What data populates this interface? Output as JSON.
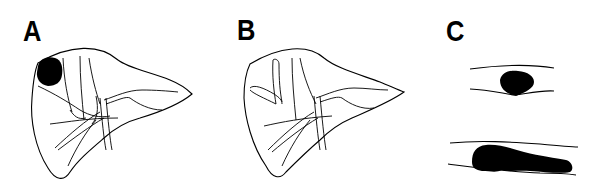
{
  "figure": {
    "panels": [
      {
        "id": "A",
        "label": "A",
        "description": "Liver outline with hepatic vessels and dark lesion in upper-left lobe"
      },
      {
        "id": "B",
        "label": "B",
        "description": "Liver outline with hepatic vessels and elongated oval structure in left lobe"
      },
      {
        "id": "C",
        "label": "C",
        "description": "Vessel cross-sections with dark filling defects: small round (top), elongated (bottom)"
      }
    ],
    "colors": {
      "ink": "#000000",
      "background": "#ffffff"
    }
  }
}
